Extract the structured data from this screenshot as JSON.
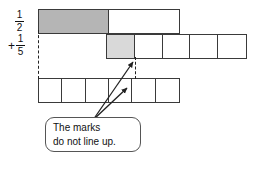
{
  "figure": {
    "title_text": "",
    "labels": {
      "first_addend": {
        "numerator": "1",
        "denominator": "2",
        "operator": ""
      },
      "second_addend": {
        "numerator": "1",
        "denominator": "5",
        "operator": "+"
      }
    },
    "bars": [
      {
        "name": "halves-bar",
        "total_cells": 2,
        "shaded_cells": 1,
        "fraction": "1/2",
        "shade_color": "#b5b5b5"
      },
      {
        "name": "fifths-bar",
        "total_cells": 5,
        "shaded_cells": 1,
        "fraction": "1/5",
        "shade_color": "#d9d9d9"
      },
      {
        "name": "sixths-bar",
        "total_cells": 6,
        "shaded_cells": 0,
        "fraction": "",
        "shade_color": "#ffffff"
      }
    ],
    "callout": {
      "line1": "The marks",
      "line2": "do not line up."
    },
    "colors": {
      "outline": "#3a3a3a",
      "callout_border": "#555555",
      "dashed_guide": "#222222",
      "background": "#ffffff",
      "text": "#111111"
    }
  }
}
